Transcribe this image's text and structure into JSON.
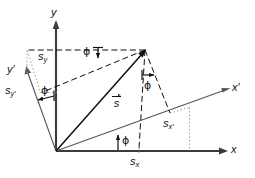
{
  "figure": {
    "type": "geometric-vector-decomposition-diagram",
    "background_color": "#ffffff",
    "line_color": "#101010",
    "labels": {
      "axis_y": "y",
      "axis_x": "x",
      "axis_y_prime": "y′",
      "axis_x_prime": "x′",
      "vector_s": "s",
      "component_sy": "s",
      "component_sy_sub": "y",
      "component_sx": "s",
      "component_sx_sub": "x",
      "component_sy_prime": "s",
      "component_sy_prime_sub": "y′",
      "component_sx_prime": "s",
      "component_sx_prime_sub": "x′",
      "angle_phi": "ϕ"
    },
    "angles": [
      {
        "name": "phi-top",
        "label": "ϕ"
      },
      {
        "name": "phi-left",
        "label": "ϕ"
      },
      {
        "name": "phi-right",
        "label": "ϕ"
      },
      {
        "name": "phi-bottom",
        "label": "ϕ"
      }
    ],
    "geometry": {
      "origin": [
        56,
        151
      ],
      "vector_tip": [
        145,
        50
      ],
      "x_axis_end": [
        226,
        151
      ],
      "y_axis_top": [
        56,
        22
      ],
      "x_prime_end": [
        229,
        89
      ],
      "y_prime_end": [
        26,
        73
      ],
      "rotation_angle_deg": 20
    }
  }
}
